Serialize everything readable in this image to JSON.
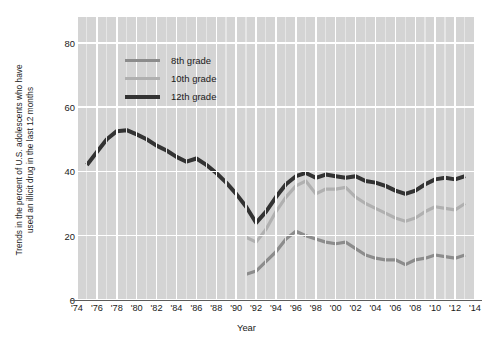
{
  "chart_data": {
    "type": "line",
    "title": "",
    "xlabel": "Year",
    "ylabel": "Trends in the percent of U.S. adolescents  who have\nused an illicit drug in the last 12 months",
    "xlim": [
      1974,
      2014
    ],
    "ylim": [
      0,
      88
    ],
    "grid": true,
    "legend_position": "upper-left-inside",
    "xtick_labels": [
      "'74",
      "'76",
      "'78",
      "'80",
      "'82",
      "'84",
      "'86",
      "'88",
      "'90",
      "'92",
      "'94",
      "'96",
      "'98",
      "'00",
      "'02",
      "'04",
      "'06",
      "'08",
      "'10",
      "'12",
      "'14"
    ],
    "xtick_values": [
      1974,
      1976,
      1978,
      1980,
      1982,
      1984,
      1986,
      1988,
      1990,
      1992,
      1994,
      1996,
      1998,
      2000,
      2002,
      2004,
      2006,
      2008,
      2010,
      2012,
      2014
    ],
    "ytick_labels": [
      "0",
      "20",
      "40",
      "60",
      "80"
    ],
    "ytick_values": [
      0,
      20,
      40,
      60,
      80
    ],
    "colors": {
      "8th grade": "#8c8c8c",
      "10th grade": "#b0b0b0",
      "12th grade": "#333333",
      "panel_background": "#d4d4d4",
      "gridline": "#ffffff",
      "axis": "#5b5b5b",
      "text": "#1a1a1a"
    },
    "series": [
      {
        "name": "8th grade",
        "color": "#8c8c8c",
        "x": [
          1991,
          1992,
          1993,
          1994,
          1995,
          1996,
          1997,
          1998,
          1999,
          2000,
          2001,
          2002,
          2003,
          2004,
          2005,
          2006,
          2007,
          2008,
          2009,
          2010,
          2011,
          2012,
          2013
        ],
        "values": [
          8.0,
          9.0,
          12.0,
          15.0,
          19.0,
          21.4,
          20.0,
          19.0,
          18.0,
          17.5,
          18.0,
          16.0,
          14.0,
          13.0,
          12.5,
          12.5,
          11.0,
          12.5,
          13.0,
          14.0,
          13.5,
          13.0,
          14.0
        ]
      },
      {
        "name": "10th grade",
        "color": "#b0b0b0",
        "x": [
          1991,
          1992,
          1993,
          1994,
          1995,
          1996,
          1997,
          1998,
          1999,
          2000,
          2001,
          2002,
          2003,
          2004,
          2005,
          2006,
          2007,
          2008,
          2009,
          2010,
          2011,
          2012,
          2013
        ],
        "values": [
          19.5,
          18.0,
          22.0,
          27.5,
          32.0,
          35.5,
          37.0,
          33.0,
          34.5,
          34.5,
          35.0,
          32.0,
          30.0,
          28.5,
          27.0,
          25.5,
          24.5,
          25.5,
          27.5,
          29.0,
          28.5,
          28.0,
          30.0
        ]
      },
      {
        "name": "12th grade",
        "color": "#333333",
        "x": [
          1975,
          1976,
          1977,
          1978,
          1979,
          1980,
          1981,
          1982,
          1983,
          1984,
          1985,
          1986,
          1987,
          1988,
          1989,
          1990,
          1991,
          1992,
          1993,
          1994,
          1995,
          1996,
          1997,
          1998,
          1999,
          2000,
          2001,
          2002,
          2003,
          2004,
          2005,
          2006,
          2007,
          2008,
          2009,
          2010,
          2011,
          2012,
          2013
        ],
        "values": [
          42.0,
          46.0,
          50.0,
          52.5,
          52.8,
          51.5,
          50.0,
          48.0,
          46.5,
          44.5,
          43.0,
          44.0,
          42.0,
          39.5,
          36.5,
          33.0,
          29.0,
          24.0,
          27.5,
          32.0,
          36.0,
          38.5,
          39.5,
          38.0,
          39.0,
          38.5,
          38.0,
          38.5,
          37.0,
          36.5,
          35.5,
          34.0,
          33.0,
          34.0,
          36.0,
          37.5,
          38.0,
          37.5,
          38.5
        ]
      }
    ]
  },
  "legend": {
    "items": [
      {
        "label": "8th grade"
      },
      {
        "label": "10th grade"
      },
      {
        "label": "12th grade"
      }
    ]
  },
  "axes": {
    "x_title": "Year",
    "y_title": "Trends in the percent of U.S. adolescents  who have\nused an illicit drug in the last 12 months"
  }
}
